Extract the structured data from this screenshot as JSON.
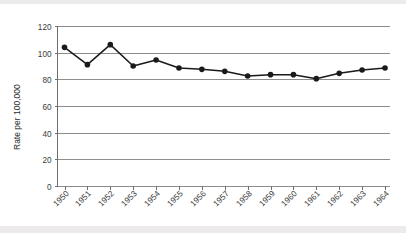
{
  "chart_data": {
    "type": "line",
    "title": "",
    "subtitle": "",
    "xlabel": "",
    "ylabel": "Rate per 100,000",
    "categories": [
      "1950",
      "1951",
      "1952",
      "1953",
      "1954",
      "1955",
      "1956",
      "1957",
      "1958",
      "1959",
      "1960",
      "1961",
      "1962",
      "1963",
      "1964"
    ],
    "values": [
      104,
      91,
      106,
      90,
      94.5,
      88.5,
      87.5,
      86,
      82.5,
      83.5,
      83.5,
      80.5,
      84.5,
      87,
      88.5
    ],
    "series": [
      {
        "name": "Rate per 100,000",
        "values": [
          104,
          91,
          106,
          90,
          94.5,
          88.5,
          87.5,
          86,
          82.5,
          83.5,
          83.5,
          80.5,
          84.5,
          87,
          88.5
        ]
      }
    ],
    "ylim": [
      0,
      120
    ],
    "yticks": [
      0,
      20,
      40,
      60,
      80,
      100,
      120
    ],
    "ytick_labels": [
      "0",
      "20",
      "40",
      "60",
      "80",
      "100",
      "120"
    ],
    "xtick_labels": [
      "1950",
      "1951",
      "1952",
      "1953",
      "1954",
      "1955",
      "1956",
      "1957",
      "1958",
      "1959",
      "1960",
      "1961",
      "1962",
      "1963",
      "1964"
    ],
    "xtick_rotation_deg": -45,
    "grid": true,
    "grid_axis": "y",
    "legend": false,
    "legend_position": "none",
    "marker": "filled-circle",
    "line_color": "#1a1a1a",
    "marker_color": "#1a1a1a",
    "grid_color": "#8d8d8d",
    "background_color": "#ffffff",
    "annotations": []
  },
  "figure": {
    "y_axis_title": "Rate per 100,000"
  }
}
